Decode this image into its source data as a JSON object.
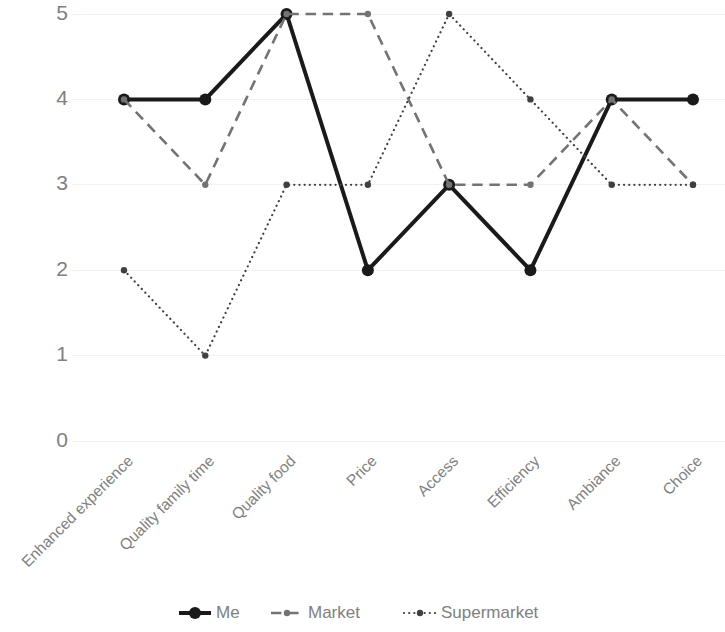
{
  "chart_data": {
    "type": "line",
    "title": "",
    "subtitle": "",
    "xlabel": "",
    "ylabel": "",
    "categories": [
      "Enhanced experience",
      "Quality family time",
      "Quality food",
      "Price",
      "Access",
      "Efficiency",
      "Ambiance",
      "Choice"
    ],
    "y_ticks": [
      "0",
      "1",
      "2",
      "3",
      "4",
      "5"
    ],
    "ylim": [
      0,
      5
    ],
    "grid": true,
    "grid_axis": "y",
    "legend_position": "bottom",
    "series": [
      {
        "name": "Me",
        "values": [
          4,
          4,
          5,
          2,
          3,
          2,
          4,
          4
        ],
        "color": "#1a1a1a",
        "line_style": "solid",
        "line_width": 4,
        "marker": "circle",
        "marker_size": 6
      },
      {
        "name": "Market",
        "values": [
          4,
          3,
          5,
          5,
          3,
          3,
          4,
          3
        ],
        "color": "#737373",
        "line_style": "dashed",
        "line_width": 2.6,
        "marker": "circle",
        "marker_size": 3.2
      },
      {
        "name": "Supermarket",
        "values": [
          2,
          1,
          3,
          3,
          5,
          4,
          3,
          3
        ],
        "color": "#404040",
        "line_style": "dotted",
        "line_width": 2.2,
        "marker": "circle",
        "marker_size": 3.2
      }
    ]
  },
  "axis": {
    "y_tick_labels": [
      "5",
      "4",
      "3",
      "2",
      "1",
      "0"
    ],
    "x_tick_labels": [
      "Enhanced experience",
      "Quality family time",
      "Quality food",
      "Price",
      "Access",
      "Efficiency",
      "Ambiance",
      "Choice"
    ],
    "x_label_rotation": "-45"
  },
  "legend": {
    "items": [
      {
        "label": "Me",
        "style": "solid"
      },
      {
        "label": "Market",
        "style": "dashed"
      },
      {
        "label": "Supermarket",
        "style": "dotted"
      }
    ]
  },
  "colors": {
    "background": "#ffffff",
    "gridline": "#f2f2f2",
    "tick_text": "#808080",
    "series_me": "#1a1a1a",
    "series_market": "#737373",
    "series_supermarket": "#404040"
  }
}
